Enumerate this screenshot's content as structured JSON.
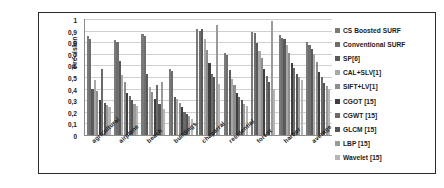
{
  "chart_data": {
    "type": "bar",
    "title": "",
    "xlabel": "",
    "ylabel": "Precision",
    "ylim": [
      0,
      1
    ],
    "grid": true,
    "legend_position": "right",
    "categories": [
      "agricultural",
      "airplane",
      "beach",
      "buildings",
      "chaparral",
      "residential",
      "forest",
      "harbor",
      "average"
    ],
    "ytick_labels": [
      "1",
      "0,9",
      "0,8",
      "0,7",
      "0,6",
      "0,5",
      "0,4",
      "0,3",
      "0,2",
      "0,1",
      "0"
    ],
    "ytick_values": [
      1,
      0.9,
      0.8,
      0.7,
      0.6,
      0.5,
      0.4,
      0.3,
      0.2,
      0.1,
      0
    ],
    "series": [
      {
        "name": "CS Boosted SURF",
        "color": "#7a7a7a",
        "values": [
          0.85,
          0.82,
          0.87,
          0.57,
          0.91,
          0.71,
          0.89,
          0.86,
          0.8
        ]
      },
      {
        "name": "Conventional SURF",
        "color": "#6e6e6e",
        "values": [
          0.83,
          0.8,
          0.85,
          0.55,
          0.9,
          0.69,
          0.88,
          0.84,
          0.78
        ]
      },
      {
        "name": "SP[6]",
        "color": "#5a5a5a",
        "values": [
          0.4,
          0.64,
          0.53,
          0.33,
          0.91,
          0.56,
          0.79,
          0.83,
          0.74
        ]
      },
      {
        "name": "CAL+SLV[1]",
        "color": "#a8a8a8",
        "values": [
          0.47,
          0.52,
          0.41,
          0.31,
          0.83,
          0.48,
          0.72,
          0.78,
          0.7
        ]
      },
      {
        "name": "SIFT+LV[1]",
        "color": "#8d8d8d",
        "values": [
          0.38,
          0.46,
          0.37,
          0.28,
          0.73,
          0.43,
          0.66,
          0.71,
          0.63
        ]
      },
      {
        "name": "CGOT [15]",
        "color": "#3f3f3f",
        "values": [
          0.3,
          0.36,
          0.31,
          0.24,
          0.62,
          0.36,
          0.57,
          0.62,
          0.54
        ]
      },
      {
        "name": "CGWT [15]",
        "color": "#6a6a6a",
        "values": [
          0.57,
          0.34,
          0.43,
          0.2,
          0.53,
          0.33,
          0.51,
          0.58,
          0.5
        ]
      },
      {
        "name": "GLCM [15]",
        "color": "#555555",
        "values": [
          0.28,
          0.3,
          0.27,
          0.18,
          0.5,
          0.3,
          0.46,
          0.53,
          0.45
        ]
      },
      {
        "name": "LBP [15]",
        "color": "#9a9a9a",
        "values": [
          0.26,
          0.27,
          0.46,
          0.16,
          0.95,
          0.27,
          0.98,
          0.5,
          0.42
        ]
      },
      {
        "name": "Wavelet [15]",
        "color": "#b5b5b5",
        "values": [
          0.24,
          0.25,
          0.22,
          0.14,
          0.44,
          0.25,
          0.4,
          0.47,
          0.4
        ]
      }
    ]
  }
}
